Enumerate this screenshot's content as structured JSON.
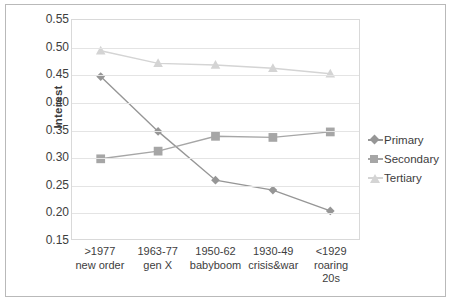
{
  "chart_data": {
    "type": "line",
    "title": "",
    "xlabel": "",
    "ylabel": "Interest",
    "ylim": [
      0.15,
      0.55
    ],
    "ytick_step": 0.05,
    "yticks": [
      "0.55",
      "0.50",
      "0.45",
      "0.40",
      "0.35",
      "0.30",
      "0.25",
      "0.20",
      "0.15"
    ],
    "grid": true,
    "legend_position": "right",
    "categories": [
      ">1977\nnew order",
      "1963-77\ngen X",
      "1950-62\nbabyboom",
      "1930-49\ncrisis&war",
      "<1929\nroaring\n20s"
    ],
    "category_lines": [
      [
        ">1977",
        "new order"
      ],
      [
        "1963-77",
        "gen X"
      ],
      [
        "1950-62",
        "babyboom"
      ],
      [
        "1930-49",
        "crisis&war"
      ],
      [
        "<1929",
        "roaring",
        "20s"
      ]
    ],
    "series": [
      {
        "name": "Primary",
        "marker": "diamond",
        "color": "#969696",
        "values": [
          0.447,
          0.347,
          0.258,
          0.24,
          0.202
        ]
      },
      {
        "name": "Secondary",
        "marker": "square",
        "color": "#a6a6a6",
        "values": [
          0.297,
          0.311,
          0.338,
          0.336,
          0.346
        ]
      },
      {
        "name": "Tertiary",
        "marker": "triangle",
        "color": "#d4d4d4",
        "values": [
          0.494,
          0.471,
          0.468,
          0.462,
          0.452
        ]
      }
    ]
  },
  "legend": {
    "items": [
      {
        "label": "Primary"
      },
      {
        "label": "Secondary"
      },
      {
        "label": "Tertiary"
      }
    ]
  }
}
